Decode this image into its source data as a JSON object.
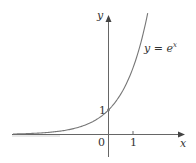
{
  "chart_data": {
    "type": "line",
    "title": "",
    "function_label": "y = e^x",
    "function_label_base": "y = e",
    "function_label_exp": "x",
    "xlabel": "x",
    "ylabel": "y",
    "x_ticks": [
      {
        "value": 0,
        "label": "0"
      },
      {
        "value": 1,
        "label": "1"
      }
    ],
    "y_ticks": [
      {
        "value": 1,
        "label": "1"
      }
    ],
    "xlim": [
      -3.9,
      3.1
    ],
    "ylim": [
      -0.9,
      4.9
    ],
    "grid": false,
    "legend": "none",
    "series": [
      {
        "name": "y = e^x",
        "x": [
          -3.9,
          -3,
          -2,
          -1.5,
          -1,
          -0.5,
          0,
          0.5,
          1,
          1.25,
          1.5,
          1.6
        ],
        "y": [
          0.02,
          0.05,
          0.135,
          0.223,
          0.368,
          0.607,
          1,
          1.649,
          2.718,
          3.49,
          4.48,
          4.95
        ]
      }
    ],
    "annotations": [
      {
        "text": "1",
        "at": [
          0,
          1
        ],
        "meaning": "y-intercept"
      }
    ]
  },
  "colors": {
    "axis": "#555555",
    "curve": "#666666",
    "text": "#333333"
  }
}
